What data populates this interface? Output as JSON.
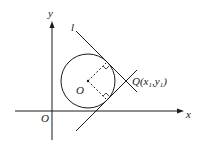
{
  "diagram": {
    "type": "geometry",
    "labels": {
      "y_axis": "y",
      "x_axis": "x",
      "origin": "O",
      "circle_center": "O",
      "line_l": "l",
      "point_q_main": "Q",
      "point_q_coords_open": "(x",
      "point_q_sub1": "1",
      "point_q_comma": ",y",
      "point_q_sub2": "1",
      "point_q_close": ")"
    },
    "colors": {
      "stroke": "#1a1a1a",
      "background": "#ffffff"
    }
  }
}
